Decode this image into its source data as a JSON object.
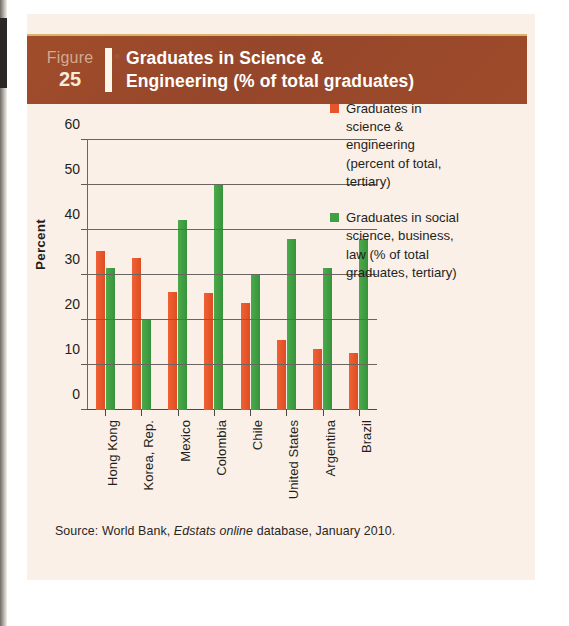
{
  "figure": {
    "label": "Figure",
    "number": "25",
    "title": "Graduates in Science & Engineering (% of total graduates)",
    "title_line1": "Graduates in Science &",
    "title_line2": "Engineering (% of total graduates)"
  },
  "source": {
    "prefix": "Source: World Bank,",
    "italic": "Edstats online",
    "suffix": "database, January 2010."
  },
  "colors": {
    "header_band": "#9c4a2a",
    "header_rule": "#d9b36a",
    "panel_background": "#fbf0e8",
    "series_orange": "#e8552b",
    "series_green": "#3f9f43",
    "axis": "#4d4945",
    "grid": "#6a6560",
    "text": "#231f1c"
  },
  "chart_data": {
    "type": "bar",
    "title": "Graduates in Science & Engineering (% of total graduates)",
    "xlabel": "",
    "ylabel": "Percent",
    "ylim": [
      0,
      60
    ],
    "yticks": [
      0,
      10,
      20,
      30,
      40,
      50,
      60
    ],
    "ytick_labels": [
      "0",
      "10",
      "20",
      "30",
      "40",
      "50",
      "60"
    ],
    "grid": true,
    "legend_position": "right",
    "categories": [
      "Hong Kong",
      "Korea, Rep.",
      "Mexico",
      "Colombia",
      "Chile",
      "United States",
      "Argentina",
      "Brazil"
    ],
    "series": [
      {
        "name": "Graduates in science & engineering (percent of total, tertiary)",
        "color": "#e8552b",
        "values": [
          35.3,
          33.8,
          26.3,
          26.0,
          23.7,
          15.6,
          13.5,
          12.6
        ]
      },
      {
        "name": "Graduates in social science, business, law (% of total graduates, tertiary)",
        "color": "#3f9f43",
        "values": [
          31.5,
          20.0,
          42.3,
          50.0,
          30.0,
          38.0,
          31.5,
          38.0
        ]
      }
    ]
  },
  "legend": {
    "items": [
      {
        "color": "#e8552b",
        "lines": [
          "Graduates in",
          "science &",
          "engineering",
          "(percent of total,",
          "tertiary)"
        ]
      },
      {
        "color": "#3f9f43",
        "lines": [
          "Graduates in social",
          "science, business,",
          "law (% of total",
          "graduates, tertiary)"
        ]
      }
    ]
  }
}
